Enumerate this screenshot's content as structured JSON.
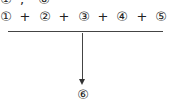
{
  "top_row": {
    "left": "①",
    "sep": ",",
    "right": "⑧"
  },
  "equation": {
    "terms": [
      "①",
      "②",
      "③",
      "④",
      "⑤"
    ],
    "operator": "+"
  },
  "result": "⑥"
}
